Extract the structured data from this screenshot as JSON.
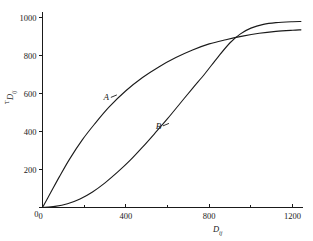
{
  "chart_data": {
    "type": "line",
    "title": "",
    "xlabel": "D_ij",
    "xlabel_main": "D",
    "xlabel_sub": "ij",
    "ylabel": "TD_ij",
    "ylabel_sup": "T",
    "ylabel_main": "D",
    "ylabel_sub": "ij",
    "xlim": [
      0,
      1250
    ],
    "ylim": [
      0,
      1030
    ],
    "grid": false,
    "legend": "inline-curve-labels",
    "x_ticks_major": [
      0,
      400,
      800,
      1200
    ],
    "x_ticks_minor": [
      200,
      600,
      1000
    ],
    "x_tick_labels": [
      "0",
      "400",
      "800",
      "1200"
    ],
    "y_ticks_major": [
      0,
      200,
      400,
      600,
      800,
      1000
    ],
    "y_tick_labels": [
      "0",
      "200",
      "400",
      "600",
      "800",
      "1000"
    ],
    "series": [
      {
        "name": "A",
        "label": "A",
        "label_x": 340,
        "label_y": 580,
        "shape": "concave-saturating",
        "x": [
          0,
          40,
          80,
          130,
          190,
          250,
          320,
          400,
          480,
          560,
          640,
          720,
          800,
          880,
          960,
          1040,
          1120,
          1200,
          1240
        ],
        "y": [
          0,
          80,
          160,
          255,
          355,
          440,
          530,
          615,
          685,
          742,
          790,
          830,
          862,
          884,
          903,
          918,
          928,
          934,
          936
        ]
      },
      {
        "name": "B",
        "label": "B",
        "label_x": 590,
        "label_y": 430,
        "shape": "sigmoid",
        "x": [
          0,
          60,
          120,
          180,
          240,
          300,
          360,
          420,
          480,
          540,
          600,
          660,
          720,
          780,
          840,
          900,
          950,
          1000,
          1060,
          1120,
          1200,
          1240
        ],
        "y": [
          0,
          6,
          20,
          45,
          82,
          130,
          186,
          248,
          318,
          392,
          468,
          548,
          628,
          706,
          790,
          868,
          915,
          945,
          965,
          974,
          979,
          980
        ]
      }
    ],
    "crossing_point": {
      "x": 900,
      "y": 868
    },
    "colors": {
      "background": "#ffffff",
      "axis": "#1a1a1a",
      "curve": "#1a1a1a",
      "text": "#1a1a1a"
    }
  }
}
